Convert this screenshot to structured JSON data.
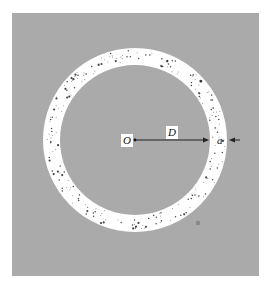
{
  "figure": {
    "background_color": "#aaaaaa",
    "panel": {
      "x": 12,
      "y": 13,
      "width": 247,
      "height": 263
    },
    "ring": {
      "center_x": 135,
      "center_y": 140,
      "outer_radius": 92,
      "inner_radius": 75,
      "fill_color": "#ffffff",
      "dot_color": "#333333",
      "dot_count": 230,
      "dot_seed": 7
    },
    "arrow_D": {
      "from_x": 135,
      "from_y": 140,
      "to_x": 209,
      "to_y": 140,
      "color": "#222222"
    },
    "arrow_a": {
      "from_x": 240,
      "from_y": 140,
      "to_x": 229,
      "to_y": 140,
      "color": "#222222"
    },
    "smudge": {
      "x": 198,
      "y": 223,
      "r": 2.2,
      "color": "#777777"
    }
  },
  "labels": {
    "origin": "O",
    "distance": "D",
    "thickness": "a"
  }
}
